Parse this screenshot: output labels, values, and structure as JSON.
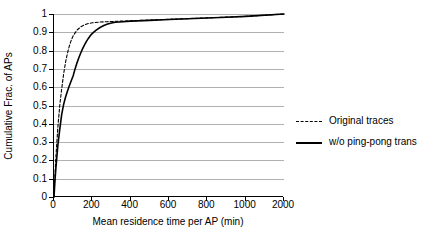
{
  "chart_data": {
    "type": "line",
    "title": "",
    "xlabel": "Mean residence time per AP (min)",
    "ylabel": "Cumulative Frac. of APs",
    "xticklabels": [
      "0",
      "200",
      "400",
      "600",
      "800",
      "1000",
      "2000"
    ],
    "xtickvalues": [
      0,
      200,
      400,
      600,
      800,
      1000,
      2000
    ],
    "x_axis_note": "categorical-style spacing: last tick jumps 1000 to 2000 at equal pixel spacing",
    "yticklabels": [
      "0",
      "0.1",
      "0.2",
      "0.3",
      "0.4",
      "0.5",
      "0.6",
      "0.7",
      "0.8",
      "0.9",
      "1"
    ],
    "ylim": [
      0,
      1
    ],
    "grid": "horizontal",
    "legend_position": "right",
    "series": [
      {
        "name": "Original traces",
        "style": "dashed",
        "color": "#000000",
        "points": [
          [
            0,
            0.0
          ],
          [
            5,
            0.12
          ],
          [
            10,
            0.22
          ],
          [
            15,
            0.3
          ],
          [
            20,
            0.38
          ],
          [
            30,
            0.5
          ],
          [
            40,
            0.59
          ],
          [
            50,
            0.67
          ],
          [
            60,
            0.735
          ],
          [
            70,
            0.785
          ],
          [
            80,
            0.825
          ],
          [
            90,
            0.857
          ],
          [
            100,
            0.881
          ],
          [
            120,
            0.912
          ],
          [
            140,
            0.93
          ],
          [
            160,
            0.941
          ],
          [
            180,
            0.948
          ],
          [
            200,
            0.952
          ],
          [
            240,
            0.956
          ],
          [
            280,
            0.958
          ],
          [
            320,
            0.96
          ],
          [
            400,
            0.963
          ],
          [
            500,
            0.967
          ],
          [
            600,
            0.971
          ],
          [
            700,
            0.975
          ],
          [
            800,
            0.979
          ],
          [
            900,
            0.983
          ],
          [
            1000,
            0.987
          ],
          [
            2000,
            1.0
          ]
        ]
      },
      {
        "name": "w/o ping-pong trans",
        "style": "solid",
        "color": "#000000",
        "points": [
          [
            0,
            0.0
          ],
          [
            5,
            0.09
          ],
          [
            10,
            0.16
          ],
          [
            15,
            0.22
          ],
          [
            20,
            0.28
          ],
          [
            30,
            0.37
          ],
          [
            40,
            0.45
          ],
          [
            50,
            0.505
          ],
          [
            60,
            0.545
          ],
          [
            70,
            0.578
          ],
          [
            80,
            0.608
          ],
          [
            90,
            0.635
          ],
          [
            100,
            0.663
          ],
          [
            110,
            0.7
          ],
          [
            120,
            0.733
          ],
          [
            130,
            0.762
          ],
          [
            140,
            0.788
          ],
          [
            150,
            0.812
          ],
          [
            160,
            0.833
          ],
          [
            170,
            0.852
          ],
          [
            180,
            0.868
          ],
          [
            190,
            0.882
          ],
          [
            200,
            0.894
          ],
          [
            220,
            0.912
          ],
          [
            240,
            0.926
          ],
          [
            260,
            0.937
          ],
          [
            280,
            0.945
          ],
          [
            300,
            0.951
          ],
          [
            320,
            0.955
          ],
          [
            360,
            0.958
          ],
          [
            400,
            0.961
          ],
          [
            500,
            0.965
          ],
          [
            600,
            0.97
          ],
          [
            700,
            0.974
          ],
          [
            800,
            0.978
          ],
          [
            900,
            0.982
          ],
          [
            1000,
            0.987
          ],
          [
            2000,
            1.0
          ]
        ]
      }
    ]
  },
  "legend": {
    "items": [
      {
        "label": "Original traces",
        "style": "dashed"
      },
      {
        "label": "w/o ping-pong trans",
        "style": "solid"
      }
    ]
  },
  "colors": {
    "axis": "#000000",
    "grid": "#b0b0b0",
    "background": "#ffffff",
    "curve": "#000000"
  }
}
